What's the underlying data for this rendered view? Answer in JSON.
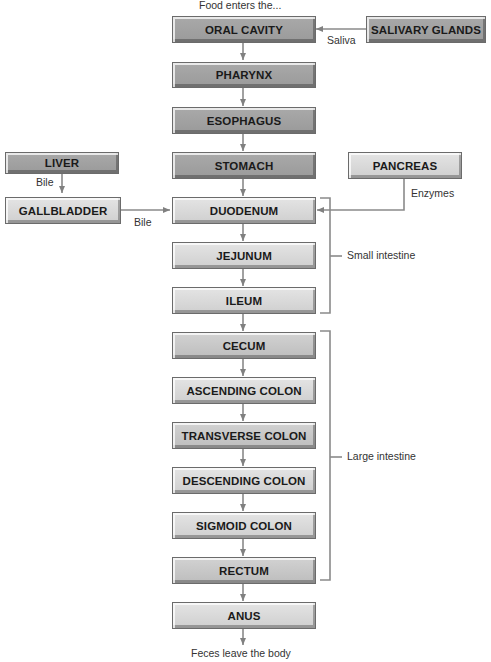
{
  "diagram": {
    "start_label": "Food enters the...",
    "end_label": "Feces leave the body",
    "main_path": [
      {
        "id": "oral-cavity",
        "label": "ORAL CAVITY"
      },
      {
        "id": "pharynx",
        "label": "PHARYNX"
      },
      {
        "id": "esophagus",
        "label": "ESOPHAGUS"
      },
      {
        "id": "stomach",
        "label": "STOMACH"
      },
      {
        "id": "duodenum",
        "label": "DUODENUM"
      },
      {
        "id": "jejunum",
        "label": "JEJUNUM"
      },
      {
        "id": "ileum",
        "label": "ILEUM"
      },
      {
        "id": "cecum",
        "label": "CECUM"
      },
      {
        "id": "ascending-colon",
        "label": "ASCENDING COLON"
      },
      {
        "id": "transverse-colon",
        "label": "TRANSVERSE COLON"
      },
      {
        "id": "descending-colon",
        "label": "DESCENDING COLON"
      },
      {
        "id": "sigmoid-colon",
        "label": "SIGMOID COLON"
      },
      {
        "id": "rectum",
        "label": "RECTUM"
      },
      {
        "id": "anus",
        "label": "ANUS"
      }
    ],
    "accessory_organs": {
      "salivary_glands": {
        "label": "SALIVARY GLANDS",
        "secretion": "Saliva",
        "target": "ORAL CAVITY"
      },
      "liver": {
        "label": "LIVER",
        "secretion": "Bile",
        "target": "GALLBLADDER"
      },
      "gallbladder": {
        "label": "GALLBLADDER",
        "secretion": "Bile",
        "target": "DUODENUM"
      },
      "pancreas": {
        "label": "PANCREAS",
        "secretion": "Enzymes",
        "target": "DUODENUM"
      }
    },
    "groups": {
      "small_intestine": "Small intestine",
      "large_intestine": "Large intestine"
    },
    "colors": {
      "dark_box": "#a3a3a3",
      "light_box": "#dadada",
      "line": "#888888"
    }
  }
}
